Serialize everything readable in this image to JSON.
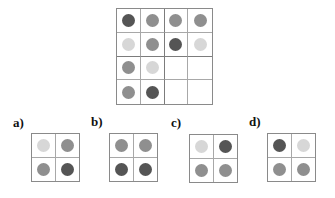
{
  "colors": {
    "dark": "#555555",
    "medium": "#8f8f8f",
    "light": "#d7d7d7",
    "empty": "transparent"
  },
  "main_grid": {
    "rows": [
      [
        "dark",
        "medium",
        "medium",
        "medium"
      ],
      [
        "light",
        "medium",
        "dark",
        "light"
      ],
      [
        "medium",
        "light",
        "empty",
        "empty"
      ],
      [
        "medium",
        "dark",
        "empty",
        "empty"
      ]
    ]
  },
  "options": [
    {
      "label": "a)",
      "cells": [
        [
          "light",
          "medium"
        ],
        [
          "medium",
          "dark"
        ]
      ]
    },
    {
      "label": "b)",
      "cells": [
        [
          "medium",
          "medium"
        ],
        [
          "dark",
          "dark"
        ]
      ]
    },
    {
      "label": "c)",
      "cells": [
        [
          "light",
          "dark"
        ],
        [
          "medium",
          "medium"
        ]
      ]
    },
    {
      "label": "d)",
      "cells": [
        [
          "dark",
          "light"
        ],
        [
          "medium",
          "medium"
        ]
      ]
    }
  ]
}
